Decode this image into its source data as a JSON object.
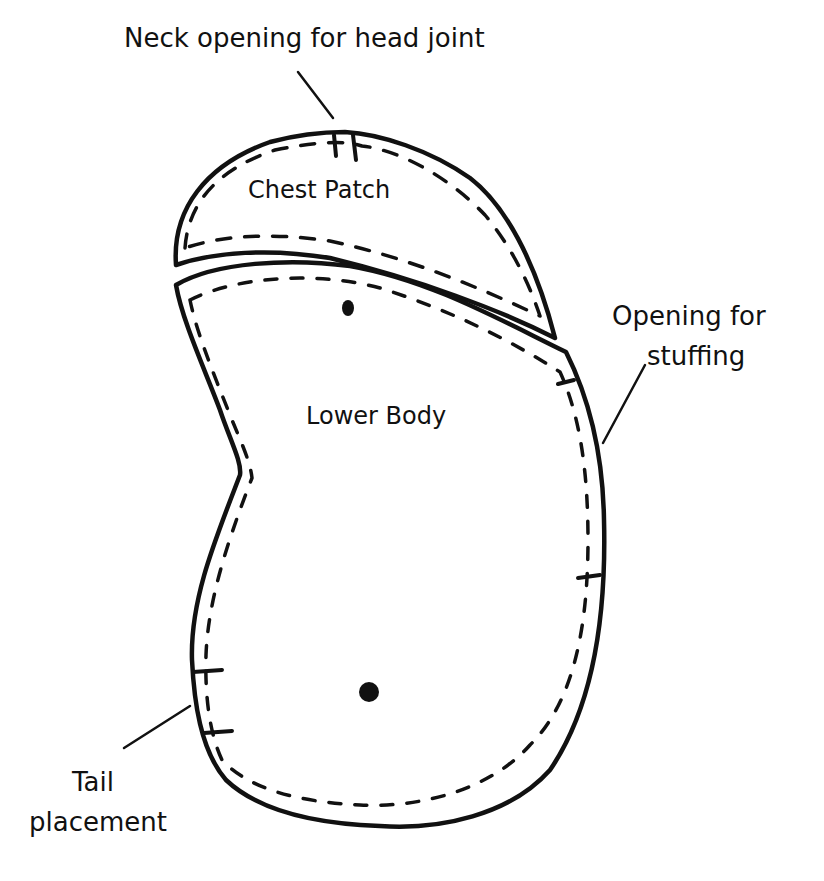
{
  "diagram": {
    "type": "sewing-pattern",
    "pieces": [
      {
        "name": "Chest Patch"
      },
      {
        "name": "Lower Body"
      }
    ],
    "annotations": {
      "neck": "Neck opening for head joint",
      "stuffing_line1": "Opening for",
      "stuffing_line2": "stuffing",
      "tail_line1": "Tail",
      "tail_line2": "placement"
    },
    "colors": {
      "ink": "#111111",
      "background": "#ffffff"
    }
  }
}
